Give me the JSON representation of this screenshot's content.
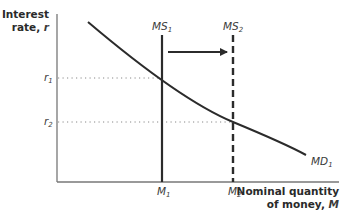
{
  "diagram": {
    "y_axis_label_line1": "Interest",
    "y_axis_label_line2": "rate, ",
    "y_axis_var": "r",
    "x_axis_label_line1": "Nominal quantity",
    "x_axis_label_line2": "of money, ",
    "x_axis_var": "M",
    "curves": {
      "money_demand": {
        "label": "MD",
        "subscript": "1"
      },
      "supply_1": {
        "label": "MS",
        "subscript": "1"
      },
      "supply_2": {
        "label": "MS",
        "subscript": "2"
      }
    },
    "y_ticks": [
      {
        "label": "r",
        "subscript": "1"
      },
      {
        "label": "r",
        "subscript": "2"
      }
    ],
    "x_ticks": [
      {
        "label": "M",
        "subscript": "1"
      },
      {
        "label": "M",
        "subscript": "2"
      }
    ],
    "shift_arrow": "MS1 to MS2 (rightward shift of money supply)",
    "colors": {
      "axis": "#777777",
      "line": "#2b2b2b",
      "dotted": "#888888",
      "text": "#3a3a3a"
    }
  }
}
